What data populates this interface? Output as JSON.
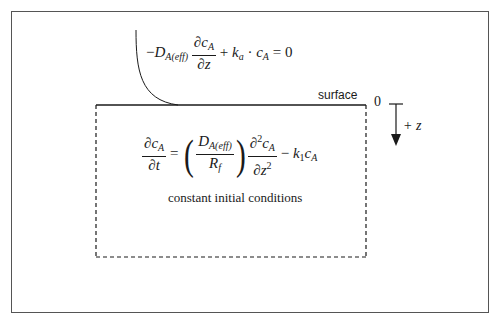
{
  "diagram": {
    "boundary_condition": {
      "minus": "−",
      "D": "D",
      "D_sub": "A(eff)",
      "num_partial": "∂",
      "num_c": "c",
      "num_sub": "A",
      "den_partial": "∂",
      "den_var": "z",
      "plus": "+",
      "k": "k",
      "k_sub": "a",
      "dot": "·",
      "c": "c",
      "c_sub": "A",
      "equals_zero": "= 0"
    },
    "governing_equation": {
      "lhs_num": "∂c",
      "lhs_num_sub": "A",
      "lhs_den": "∂t",
      "equals": "=",
      "D": "D",
      "D_sub": "A(eff)",
      "R": "R",
      "R_sub": "f",
      "d2_num": "∂",
      "d2_num_sup": "2",
      "d2_c": "c",
      "d2_c_sub": "A",
      "d2_den": "∂z",
      "d2_den_sup": "2",
      "minus": "−",
      "k": "k",
      "k_sub": "1",
      "c": "c",
      "c_sub": "A"
    },
    "labels": {
      "surface": "surface",
      "origin": "0",
      "axis": "+ z",
      "initial_conditions": "constant initial conditions"
    },
    "colors": {
      "line": "#1a1a1a",
      "frame": "#555555",
      "background": "#ffffff"
    }
  }
}
